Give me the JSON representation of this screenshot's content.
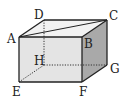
{
  "figure": {
    "type": "rectangular-prism",
    "colors": {
      "background": "#ffffff",
      "top_face": "#f2f2f2",
      "front_face": "#e4e4e4",
      "right_face": "#a9a9a9",
      "edge": "#222222",
      "hidden_edge": "#333333"
    },
    "vertices": {
      "A": {
        "label": "A",
        "x": 19,
        "y": 37,
        "lx": 7,
        "ly": 43
      },
      "B": {
        "label": "B",
        "x": 82,
        "y": 37,
        "lx": 84,
        "ly": 48
      },
      "C": {
        "label": "C",
        "x": 107,
        "y": 20,
        "lx": 109,
        "ly": 20
      },
      "D": {
        "label": "D",
        "x": 44,
        "y": 20,
        "lx": 34,
        "ly": 19
      },
      "E": {
        "label": "E",
        "x": 19,
        "y": 82,
        "lx": 12,
        "ly": 96
      },
      "F": {
        "label": "F",
        "x": 82,
        "y": 82,
        "lx": 79,
        "ly": 96
      },
      "G": {
        "label": "G",
        "x": 107,
        "y": 65,
        "lx": 110,
        "ly": 73
      },
      "H": {
        "label": "H",
        "x": 44,
        "y": 65,
        "lx": 34,
        "ly": 65
      }
    },
    "visible_edges": [
      "AB",
      "BC",
      "CD",
      "DA",
      "AE",
      "BF",
      "CG",
      "EF",
      "FG",
      "AC"
    ],
    "hidden_edges": [
      "DH",
      "EH",
      "HG"
    ],
    "diagonal": "AC"
  }
}
